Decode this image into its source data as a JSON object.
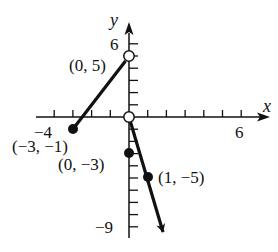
{
  "chart_data": {
    "type": "line",
    "title": "",
    "xlabel": "x",
    "ylabel": "y",
    "xlim": [
      -5,
      7
    ],
    "ylim": [
      -10,
      7
    ],
    "grid": false,
    "x_tick_labels": [
      {
        "value": -4,
        "label": "−4"
      },
      {
        "value": 6,
        "label": "6"
      }
    ],
    "y_tick_labels": [
      {
        "value": 6,
        "label": "6"
      },
      {
        "value": -9,
        "label": "−9"
      }
    ],
    "x_ticks": [
      -4,
      -3,
      -2,
      -1,
      1,
      2,
      3,
      4,
      5,
      6
    ],
    "y_ticks": [
      6,
      5,
      4,
      3,
      2,
      1,
      -1,
      -2,
      -3,
      -4,
      -5,
      -6,
      -7,
      -8,
      -9
    ],
    "series": [
      {
        "name": "segment-left",
        "points": [
          {
            "x": -3,
            "y": -1
          },
          {
            "x": 0,
            "y": 5
          }
        ],
        "endpoints": [
          {
            "x": -3,
            "y": -1,
            "style": "closed"
          },
          {
            "x": 0,
            "y": 5,
            "style": "open"
          }
        ]
      },
      {
        "name": "ray-right",
        "points": [
          {
            "x": 0,
            "y": 0
          },
          {
            "x": 1,
            "y": -5
          },
          {
            "x": 1.85,
            "y": -9.6
          }
        ],
        "endpoints": [
          {
            "x": 0,
            "y": 0,
            "style": "open"
          }
        ],
        "arrow_end": true
      },
      {
        "name": "isolated-point",
        "points": [
          {
            "x": 0,
            "y": -3
          }
        ],
        "endpoints": [
          {
            "x": 0,
            "y": -3,
            "style": "closed"
          }
        ]
      }
    ],
    "annotations": [
      {
        "text": "(0, 5)",
        "x": 0,
        "y": 5
      },
      {
        "text": "(−3, −1)",
        "x": -3,
        "y": -1
      },
      {
        "text": "(0, −3)",
        "x": 0,
        "y": -3
      },
      {
        "text": "(1, −5)",
        "x": 1,
        "y": -5
      }
    ]
  },
  "labels": {
    "x_axis": "x",
    "y_axis": "y",
    "tick_x_neg4": "−4",
    "tick_x_6": "6",
    "tick_y_6": "6",
    "tick_y_neg9": "−9",
    "pt_0_5": "(0, 5)",
    "pt_neg3_neg1": "(−3, −1)",
    "pt_0_neg3": "(0, −3)",
    "pt_1_neg5": "(1, −5)"
  }
}
